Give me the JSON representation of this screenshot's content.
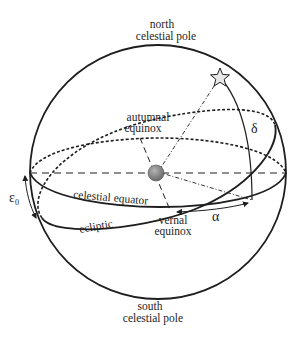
{
  "diagram": {
    "labels": {
      "north_pole_line1": "north",
      "north_pole_line2": "celestial pole",
      "south_pole_line1": "south",
      "south_pole_line2": "celestial pole",
      "autumnal_line1": "autumnal",
      "autumnal_line2": "equinox",
      "vernal_line1": "vernal",
      "vernal_line2": "equinox",
      "celestial_equator": "celestial equator",
      "ecliptic": "ecliptic",
      "right_ascension": "α",
      "declination": "δ",
      "obliquity": "ε",
      "obliquity_subscript": "0"
    },
    "elements": {
      "star": "star-icon",
      "earth": "earth-sphere"
    },
    "colors": {
      "line": "#1e1e1e",
      "earth": "#8a8a8a",
      "star_fill": "#e8e8e8"
    }
  }
}
